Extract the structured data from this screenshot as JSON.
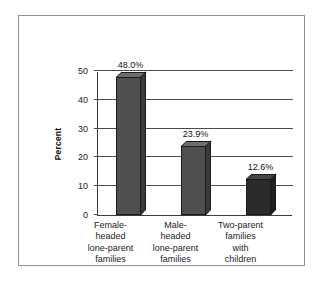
{
  "chart_data": {
    "type": "bar",
    "title": "",
    "xlabel": "",
    "ylabel": "Percent",
    "ylim": [
      0,
      50
    ],
    "yticks": [
      0,
      10,
      20,
      30,
      40,
      50
    ],
    "ytick_labels": [
      "0",
      "10",
      "20",
      "30",
      "40",
      "50"
    ],
    "grid": true,
    "legend": "none",
    "categories": [
      "Female-\nheaded\nlone-parent\nfamilies",
      "Male-\nheaded\nlone-parent\nfamilies",
      "Two-parent\nfamilies\nwith\nchildren"
    ],
    "values": [
      48.0,
      23.9,
      12.6
    ],
    "data_labels": [
      "48.0%",
      "23.9%",
      "12.6%"
    ],
    "bar_colors": [
      "#4f4f4f",
      "#4f4f4f",
      "#2b2b2b"
    ],
    "bar_top_colors": [
      "#6e6e6e",
      "#6e6e6e",
      "#454545"
    ],
    "bar_side_colors": [
      "#3a3a3a",
      "#3a3a3a",
      "#1f1f1f"
    ]
  },
  "axes": {
    "y_title": "Percent"
  },
  "colors": {
    "frame_border": "#8e8e8e",
    "axis": "#3b3b3b",
    "gridline": "#4a4a4a",
    "text": "#1a1a1a",
    "background": "#ffffff"
  }
}
